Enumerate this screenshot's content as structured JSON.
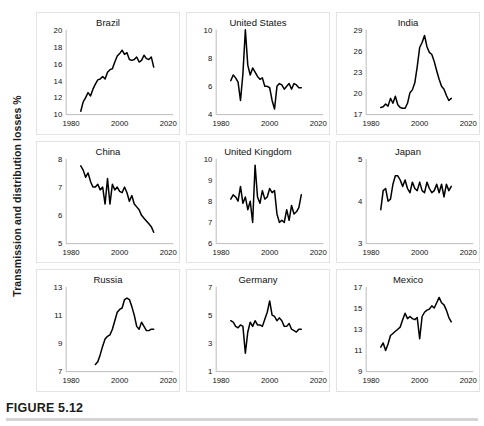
{
  "figure": {
    "caption": "FIGURE 5.12",
    "ylabel": "Transmission and distribution losses %"
  },
  "chart_data": {
    "type": "line",
    "title": "FIGURE 5.12",
    "ylabel": "Transmission and distribution losses %",
    "xlabel": "",
    "layout": {
      "rows": 3,
      "cols": 3,
      "grid": false,
      "legend": "none"
    },
    "shared_xticks": [
      1980,
      2000,
      2020
    ],
    "xlim": [
      1978,
      2022
    ],
    "panels": [
      {
        "title": "Brazil",
        "ylim": [
          10,
          20
        ],
        "yticks": [
          10,
          12,
          14,
          16,
          18,
          20
        ],
        "xticks": [
          1980,
          2000,
          2020
        ],
        "x": [
          1984,
          1985,
          1986,
          1987,
          1988,
          1989,
          1990,
          1991,
          1992,
          1993,
          1994,
          1995,
          1996,
          1997,
          1998,
          1999,
          2000,
          2001,
          2002,
          2003,
          2004,
          2005,
          2006,
          2007,
          2008,
          2009,
          2010,
          2011,
          2012,
          2013,
          2014
        ],
        "values": [
          10.4,
          11.5,
          12.0,
          12.6,
          12.2,
          13.0,
          13.6,
          14.1,
          14.2,
          14.5,
          14.2,
          15.0,
          15.3,
          15.4,
          16.2,
          16.9,
          17.2,
          17.6,
          17.1,
          17.3,
          16.5,
          16.4,
          16.5,
          16.8,
          16.2,
          16.4,
          17.0,
          16.6,
          16.5,
          16.8,
          15.6
        ]
      },
      {
        "title": "United States",
        "ylim": [
          4,
          10
        ],
        "yticks": [
          4,
          6,
          8,
          10
        ],
        "xticks": [
          1980,
          2000,
          2020
        ],
        "x": [
          1984,
          1985,
          1986,
          1987,
          1988,
          1989,
          1990,
          1991,
          1992,
          1993,
          1994,
          1995,
          1996,
          1997,
          1998,
          1999,
          2000,
          2001,
          2002,
          2003,
          2004,
          2005,
          2006,
          2007,
          2008,
          2009,
          2010,
          2011,
          2012,
          2013
        ],
        "values": [
          6.4,
          6.8,
          6.6,
          6.3,
          5.0,
          6.9,
          10.0,
          7.5,
          6.8,
          7.3,
          7.0,
          6.7,
          6.5,
          6.6,
          6.0,
          6.0,
          5.9,
          5.0,
          4.4,
          6.0,
          6.2,
          6.1,
          5.8,
          6.0,
          6.2,
          5.8,
          6.2,
          6.1,
          5.9,
          5.9
        ]
      },
      {
        "title": "India",
        "ylim": [
          17,
          29
        ],
        "yticks": [
          17,
          20,
          23,
          26,
          29
        ],
        "xticks": [
          1980,
          2000,
          2020
        ],
        "x": [
          1984,
          1985,
          1986,
          1987,
          1988,
          1989,
          1990,
          1991,
          1992,
          1993,
          1994,
          1995,
          1996,
          1997,
          1998,
          1999,
          2000,
          2001,
          2002,
          2003,
          2004,
          2005,
          2006,
          2007,
          2008,
          2009,
          2010,
          2011,
          2012,
          2013
        ],
        "values": [
          18.0,
          18.1,
          18.5,
          18.2,
          19.3,
          18.6,
          19.6,
          18.4,
          18.0,
          17.9,
          17.9,
          18.6,
          20.1,
          20.5,
          21.5,
          23.8,
          26.5,
          27.2,
          28.2,
          26.6,
          25.8,
          25.5,
          24.5,
          23.2,
          22.0,
          21.0,
          20.6,
          19.7,
          19.0,
          19.3
        ]
      },
      {
        "title": "China",
        "ylim": [
          5,
          8
        ],
        "yticks": [
          5,
          6,
          7,
          8
        ],
        "xticks": [
          1980,
          2000,
          2020
        ],
        "x": [
          1984,
          1985,
          1986,
          1987,
          1988,
          1989,
          1990,
          1991,
          1992,
          1993,
          1994,
          1995,
          1996,
          1997,
          1998,
          1999,
          2000,
          2001,
          2002,
          2003,
          2004,
          2005,
          2006,
          2007,
          2008,
          2009,
          2010,
          2011,
          2012,
          2013,
          2014
        ],
        "values": [
          7.75,
          7.6,
          7.35,
          7.5,
          7.2,
          7.0,
          7.0,
          7.1,
          6.9,
          7.0,
          6.4,
          7.3,
          6.4,
          7.1,
          6.9,
          7.0,
          6.85,
          6.8,
          7.0,
          6.8,
          6.5,
          6.7,
          6.4,
          6.3,
          6.2,
          6.0,
          5.9,
          5.8,
          5.7,
          5.6,
          5.4
        ]
      },
      {
        "title": "United Kingdom",
        "ylim": [
          6,
          10
        ],
        "yticks": [
          6,
          7,
          8,
          9,
          10
        ],
        "xticks": [
          1980,
          2000,
          2020
        ],
        "x": [
          1984,
          1985,
          1986,
          1987,
          1988,
          1989,
          1990,
          1991,
          1992,
          1993,
          1994,
          1995,
          1996,
          1997,
          1998,
          1999,
          2000,
          2001,
          2002,
          2003,
          2004,
          2005,
          2006,
          2007,
          2008,
          2009,
          2010,
          2011,
          2012,
          2013
        ],
        "values": [
          8.1,
          8.3,
          8.2,
          8.0,
          8.7,
          7.9,
          8.2,
          7.6,
          8.0,
          7.0,
          9.7,
          8.2,
          7.9,
          8.5,
          8.1,
          8.2,
          8.6,
          8.4,
          8.5,
          7.4,
          7.0,
          7.1,
          7.0,
          7.6,
          7.1,
          7.8,
          7.4,
          7.5,
          7.7,
          8.3
        ]
      },
      {
        "title": "Japan",
        "ylim": [
          3,
          5
        ],
        "yticks": [
          3,
          4,
          5
        ],
        "xticks": [
          1980,
          2000,
          2020
        ],
        "x": [
          1984,
          1985,
          1986,
          1987,
          1988,
          1989,
          1990,
          1991,
          1992,
          1993,
          1994,
          1995,
          1996,
          1997,
          1998,
          1999,
          2000,
          2001,
          2002,
          2003,
          2004,
          2005,
          2006,
          2007,
          2008,
          2009,
          2010,
          2011,
          2012,
          2013
        ],
        "values": [
          3.8,
          4.25,
          4.3,
          4.0,
          4.05,
          4.4,
          4.6,
          4.6,
          4.5,
          4.35,
          4.5,
          4.3,
          4.2,
          4.45,
          4.3,
          4.25,
          4.45,
          4.25,
          4.2,
          4.45,
          4.3,
          4.2,
          4.25,
          4.4,
          4.2,
          4.4,
          4.1,
          4.4,
          4.25,
          4.35
        ]
      },
      {
        "title": "Russia",
        "ylim": [
          7,
          13
        ],
        "yticks": [
          7,
          9,
          11,
          13
        ],
        "xticks": [
          1980,
          2000,
          2020
        ],
        "x": [
          1990,
          1991,
          1992,
          1993,
          1994,
          1995,
          1996,
          1997,
          1998,
          1999,
          2000,
          2001,
          2002,
          2003,
          2004,
          2005,
          2006,
          2007,
          2008,
          2009,
          2010,
          2011,
          2012,
          2013,
          2014
        ],
        "values": [
          7.5,
          7.7,
          8.2,
          8.8,
          9.3,
          9.5,
          9.6,
          10.0,
          10.6,
          11.2,
          11.4,
          11.5,
          12.1,
          12.2,
          12.1,
          11.6,
          11.0,
          10.2,
          10.0,
          10.5,
          10.2,
          9.9,
          9.9,
          10.0,
          10.0
        ]
      },
      {
        "title": "Germany",
        "ylim": [
          1,
          7
        ],
        "yticks": [
          1,
          3,
          5,
          7
        ],
        "xticks": [
          1980,
          2000,
          2020
        ],
        "x": [
          1984,
          1985,
          1986,
          1987,
          1988,
          1989,
          1990,
          1991,
          1992,
          1993,
          1994,
          1995,
          1996,
          1997,
          1998,
          1999,
          2000,
          2001,
          2002,
          2003,
          2004,
          2005,
          2006,
          2007,
          2008,
          2009,
          2010,
          2011,
          2012,
          2013
        ],
        "values": [
          4.6,
          4.5,
          4.2,
          4.1,
          4.3,
          4.2,
          2.3,
          3.8,
          4.5,
          4.2,
          4.6,
          4.3,
          4.3,
          4.2,
          4.7,
          5.2,
          6.0,
          5.0,
          4.9,
          4.6,
          4.8,
          4.6,
          4.2,
          4.2,
          4.4,
          4.0,
          3.9,
          3.8,
          4.0,
          4.0
        ]
      },
      {
        "title": "Mexico",
        "ylim": [
          9,
          17
        ],
        "yticks": [
          9,
          11,
          13,
          15,
          17
        ],
        "xticks": [
          1980,
          2000,
          2020
        ],
        "x": [
          1984,
          1985,
          1986,
          1987,
          1988,
          1989,
          1990,
          1991,
          1992,
          1993,
          1994,
          1995,
          1996,
          1997,
          1998,
          1999,
          2000,
          2001,
          2002,
          2003,
          2004,
          2005,
          2006,
          2007,
          2008,
          2009,
          2010,
          2011,
          2012,
          2013
        ],
        "values": [
          11.3,
          11.7,
          11.0,
          11.6,
          12.4,
          12.6,
          12.8,
          13.0,
          13.2,
          13.9,
          14.5,
          14.0,
          14.2,
          14.0,
          13.9,
          14.1,
          12.1,
          14.2,
          14.6,
          14.8,
          14.9,
          15.2,
          15.0,
          15.5,
          16.0,
          15.5,
          15.3,
          14.8,
          14.1,
          13.7
        ]
      }
    ]
  }
}
